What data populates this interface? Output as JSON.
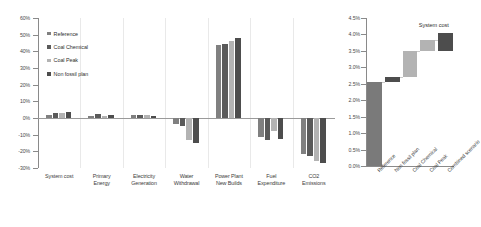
{
  "chart_data": [
    {
      "type": "bar",
      "id": "grouped-bar",
      "title": "",
      "xlabel": "",
      "ylabel": "",
      "ylim": [
        -0.3,
        0.6
      ],
      "ytick_values": [
        -0.3,
        -0.2,
        -0.1,
        0.0,
        0.1,
        0.2,
        0.3,
        0.4,
        0.5,
        0.6
      ],
      "ytick_labels": [
        "-30%",
        "-20%",
        "-10%",
        "0%",
        "10%",
        "20%",
        "30%",
        "40%",
        "50%",
        "60%"
      ],
      "grid": "vertical-category-separators",
      "legend_position": "upper-left-inside",
      "categories": [
        "System cost",
        "Primary Energy",
        "Electricity Generation",
        "Water Withdrawal",
        "Power Plant New Builds",
        "Fuel Expenditure",
        "CO2 Emissions"
      ],
      "category_lines": [
        [
          "System cost",
          ""
        ],
        [
          "Primary",
          "Energy"
        ],
        [
          "Electricity",
          "Generation"
        ],
        [
          "Water",
          "Withdrawal"
        ],
        [
          "Power Plant",
          "New Builds"
        ],
        [
          "Fuel",
          "Expenditure"
        ],
        [
          "CO2",
          "Emissions"
        ]
      ],
      "series": [
        {
          "name": "Reference",
          "color": "#808080",
          "values": [
            0.018,
            0.01,
            0.017,
            -0.035,
            0.44,
            -0.115,
            -0.215
          ]
        },
        {
          "name": "Coal Chemical",
          "color": "#5a5a5a",
          "values": [
            0.028,
            0.022,
            0.02,
            -0.045,
            0.445,
            -0.13,
            -0.225
          ]
        },
        {
          "name": "Coal Peak",
          "color": "#b3b3b3",
          "values": [
            0.033,
            0.01,
            0.017,
            -0.13,
            0.465,
            -0.075,
            -0.26
          ]
        },
        {
          "name": "Non fossil plan",
          "color": "#4d4d4d",
          "values": [
            0.035,
            0.02,
            0.014,
            -0.15,
            0.48,
            -0.125,
            -0.27
          ]
        }
      ]
    },
    {
      "type": "bar",
      "id": "waterfall",
      "title": "System cost",
      "xlabel": "",
      "ylabel": "",
      "ylim": [
        0.0,
        0.045
      ],
      "ytick_values": [
        0.0,
        0.005,
        0.01,
        0.015,
        0.02,
        0.025,
        0.03,
        0.035,
        0.04,
        0.045
      ],
      "ytick_labels": [
        "0.0%",
        "0.5%",
        "1.0%",
        "1.5%",
        "2.0%",
        "2.5%",
        "3.0%",
        "3.5%",
        "4.0%",
        "4.5%"
      ],
      "grid": "off",
      "legend_position": "none",
      "categories": [
        "Reference",
        "Non fossil plan",
        "Coal Chemical",
        "Coal Peak",
        "Combined scenario"
      ],
      "bars": [
        {
          "label": "Reference",
          "base": 0.0,
          "top": 0.0255,
          "kind": "total",
          "color": "#7a7a7a"
        },
        {
          "label": "Non fossil plan",
          "base": 0.0255,
          "top": 0.0272,
          "kind": "increment",
          "color": "#4d4d4d"
        },
        {
          "label": "Coal Chemical",
          "base": 0.0272,
          "top": 0.035,
          "kind": "increment",
          "color": "#b3b3b3"
        },
        {
          "label": "Coal Peak",
          "base": 0.035,
          "top": 0.0382,
          "kind": "increment",
          "color": "#b3b3b3"
        },
        {
          "label": "Combined scenario",
          "base": 0.035,
          "top": 0.0405,
          "kind": "total",
          "color": "#4d4d4d"
        }
      ]
    }
  ],
  "left_chart": {
    "legend": [
      {
        "label": "Reference",
        "color": "#808080"
      },
      {
        "label": "Coal Chemical",
        "color": "#5a5a5a"
      },
      {
        "label": "Coal Peak",
        "color": "#b3b3b3"
      },
      {
        "label": "Non fossil plan",
        "color": "#4d4d4d"
      }
    ]
  },
  "right_chart": {
    "title": "System cost"
  }
}
